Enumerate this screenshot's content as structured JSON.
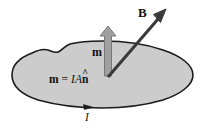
{
  "figure": {
    "labels": {
      "field_vector": "B",
      "moment_vector": "m",
      "moment_equation_lhs": "m",
      "moment_equation_eq": "=",
      "moment_equation_current": "I",
      "moment_equation_area": "A",
      "moment_equation_normal": "n",
      "moment_equation_hat": "^",
      "current": "I"
    },
    "colors": {
      "background": "#ffffff",
      "loop_fill": "#cccccc",
      "loop_outline": "#1a1a1a",
      "field_arrow": "#3a3a3a",
      "moment_arrow": "#9a9a9a",
      "moment_arrow_outline": "#6f6f6f",
      "text": "#111111"
    },
    "geometry": {
      "loop_center_x": 102,
      "loop_center_y": 76,
      "vector_origin_x": 108,
      "vector_origin_y": 76,
      "field_tip_x": 166,
      "field_tip_y": 9,
      "moment_tip_x": 108,
      "moment_tip_y": 27,
      "current_arrow_x": 89,
      "current_arrow_y": 107
    }
  }
}
